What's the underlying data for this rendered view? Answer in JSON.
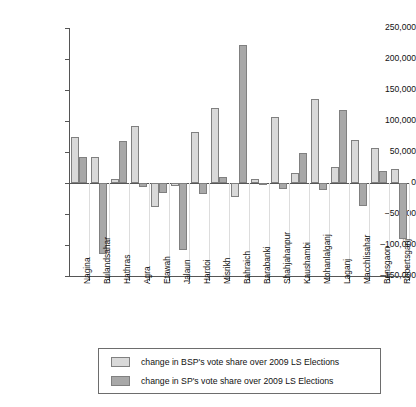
{
  "chart_data": {
    "type": "bar",
    "title": "",
    "subtitle": "",
    "xlabel": "",
    "ylabel": "",
    "ylim": [
      -150000,
      250000
    ],
    "ytick_step": 50000,
    "yticks": [
      250000,
      200000,
      150000,
      100000,
      50000,
      0,
      -50000,
      -100000,
      -150000
    ],
    "ytick_labels": [
      "250,000",
      "200,000",
      "150,000",
      "100,000",
      "50,000",
      "0",
      "–50,000",
      "–100,000",
      "–150,000"
    ],
    "grid": "vertical-category-separators",
    "legend_position": "bottom-center",
    "categories": [
      "Nagina",
      "Bulandsahar",
      "Hathras",
      "Agra",
      "Etawah",
      "Jalaun",
      "Hardoi",
      "Misrikh",
      "Bahraich",
      "Barabanki",
      "Shahjahanpur",
      "Kaushambi",
      "Mohanlalganj",
      "Laganj",
      "Macchlisahar",
      "Bansgaon",
      "Robertsganj"
    ],
    "series": [
      {
        "name": "change in BSP's vote share over 2009 LS Elections",
        "color": "#d9d9d9",
        "values": [
          74000,
          42000,
          6000,
          92000,
          -6000,
          -5000,
          82000,
          121000,
          -23000,
          107000,
          16000,
          135000,
          26000,
          57000,
          23000,
          0,
          0
        ]
      },
      {
        "name": "change in SP's vote share over 2009 LS Elections",
        "color": "#a8a8a8",
        "values": [
          42000,
          -114000,
          68000,
          -38000,
          -16000,
          -108000,
          -17000,
          9000,
          223000,
          -10000,
          48000,
          -12000,
          117000,
          -37000,
          20000,
          -90000,
          0
        ]
      }
    ],
    "data_by_category": [
      {
        "category": "Nagina",
        "bsp": 74000,
        "sp": 42000
      },
      {
        "category": "Bulandsahar",
        "bsp": 42000,
        "sp": -114000
      },
      {
        "category": "Hathras",
        "bsp": 6000,
        "sp": 68000
      },
      {
        "category": "Agra",
        "bsp": 92000,
        "sp": -6000
      },
      {
        "category": "Etawah",
        "bsp": -38000,
        "sp": -16000
      },
      {
        "category": "Jalaun",
        "bsp": -5000,
        "sp": -108000
      },
      {
        "category": "Hardoi",
        "bsp": 82000,
        "sp": -17000
      },
      {
        "category": "Misrikh",
        "bsp": 121000,
        "sp": 9000
      },
      {
        "category": "Bahraich",
        "bsp": -23000,
        "sp": 223000
      },
      {
        "category": "Barabanki",
        "bsp": 6000,
        "sp": -1000
      },
      {
        "category": "Shahjahanpur",
        "bsp": 107000,
        "sp": -10000
      },
      {
        "category": "Kaushambi",
        "bsp": 16000,
        "sp": 48000
      },
      {
        "category": "Mohanlalganj",
        "bsp": 135000,
        "sp": -12000
      },
      {
        "category": "Laganj",
        "bsp": 26000,
        "sp": 117000
      },
      {
        "category": "Macchlisahar",
        "bsp": 69000,
        "sp": -37000
      },
      {
        "category": "Bansgaon",
        "bsp": 57000,
        "sp": 20000
      },
      {
        "category": "Robertsganj",
        "bsp": 23000,
        "sp": -90000
      }
    ]
  },
  "legend": {
    "entries": [
      {
        "label": "change in BSP's vote share over 2009 LS Elections",
        "color": "#d9d9d9"
      },
      {
        "label": "change in SP's vote share over 2009 LS Elections",
        "color": "#a8a8a8"
      }
    ]
  }
}
